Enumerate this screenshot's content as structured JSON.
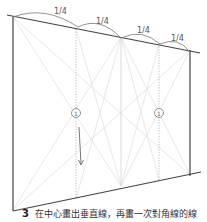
{
  "diagram": {
    "fractions": [
      "1/4",
      "1/4",
      "1/4",
      "1/4"
    ],
    "circle_labels": [
      "①",
      "①"
    ],
    "caption": {
      "step": "3",
      "text": "在中心畫出垂直線，再畫一次對角線的線"
    },
    "colors": {
      "frame": "#444444",
      "guide": "#d8d8d8",
      "dotted": "#aaaaaa"
    }
  }
}
